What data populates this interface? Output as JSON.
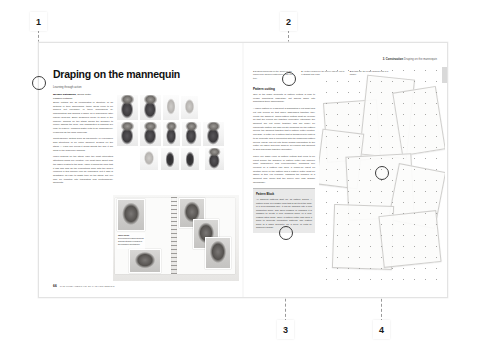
{
  "document": {
    "type": "book-spread",
    "background_color": "#ffffff",
    "page_color": "#ffffff",
    "accent_color": "#1a1a1a"
  },
  "callouts": [
    {
      "id": "1",
      "label": "1",
      "position": "top-left"
    },
    {
      "id": "2",
      "label": "2",
      "position": "top-center"
    },
    {
      "id": "3",
      "label": "3",
      "position": "bottom-center"
    },
    {
      "id": "4",
      "label": "4",
      "position": "bottom-right"
    }
  ],
  "left_page": {
    "headline": "Draping on the mannequin",
    "standfirst": "Learning through action",
    "byline_name": "Melanie Nathanson,",
    "byline_role": "Senior Tutor,",
    "byline_org": "Fashion Knitwear",
    "body": [
      "Some clothes are so complicated in structure or so detailed in their dimensions, these ideas need to be worked out physically in three dimensions by manipulating and draping a fabric on a mannequin after careful analysis. Since designers prefer to work in the manner, draping on the stand allows the designer to clearly assess the form. The possibilities of shaping are easy to resolve, enabling subtle cuts to be progressively examined as the work proceeds.",
      "Contemporary details such as asymmetry or expressive bias structures of an entire garment. Draped on the stand — each one keeps it forms affects the way it will hang in the sequence shaping.",
      "When draping on the stand, offer the most interesting attentions forms are created; you must think about how the fabric relates to the body. Make it follow the form that it has and how do the proportions work with the body? Working in this manner can be rewarding, but it also is debatable; its easy to waste time on the stand, but you may be tempted into translating and contemporary garments."
    ],
    "photo_grid_caption": "Draping sequence on the mannequin",
    "sketchbook_note_title": "Work book",
    "sketchbook_note_body": "Development pages showing draping studies recorded in the designer sketchbook.",
    "folio_number": "66",
    "folio_text": "THE FUNDAMENTALS OF FASHION DESIGN"
  },
  "right_page": {
    "running_head_section": "3. Construction",
    "running_head_title": "Draping on the mannequin",
    "captions": [
      {
        "label": "1",
        "text": "Draping garments for the jacket on the mannequin allows construction of the full toile."
      },
      {
        "label": "2",
        "text": "Another muslin for the sleeve can be cut to a straight and plain."
      },
      {
        "label": "3",
        "text": "Details like the seam finishes lock in a usable."
      }
    ],
    "subhead": "Pattern cutting",
    "body": [
      "One of the basic concepts of pattern cutting is how to render something essentially flat appear fabric into something three-dimensional.",
      "A paper pattern or a garment is dismantled if cut apart and cut into pieces so that when assembled together they create the garment. Good pattern cutting must be precise so that the pieces will together accurately otherwise the garment will not come together and will finally be inaccurate pattern will also create problems for the pattern pieces, the garment together that a pattern cutter creates. Likewise, a cutter on a pattern that is transferred to cloth is to be accurate and a connected with the balancing pattern pieces. These can cut into these seams information to the cutter, so fabric and help achieve an ironing and garment to sew and seam together accurately.",
      "There are basic rules of pattern cutting that need to be learnt before the designer or pattern cutter can improve more productively and experimentally. Changing one element of a pattern can have a knock-on effect on another piece of the pattern and a pattern cutter must be aware of this. For example, changing the armhole of a garment may mean that the sleeve may also change accordingly."
    ],
    "panel_title": "Pattern Block",
    "panel_body": "All garment patterns start life as pattern blocks. A pattern block is a master form that is set to fit the body in a fixed standard size. It can be modified into a new production block, and when finished or changed it is possible to create a new, modified block, or a new, custom fitted block. Once a pattern cutter has used a block to generate production patterns. The pattern block is a basic geometry for a piece of cloth by draping a design.",
    "pattern_caption": "Pattern pieces laid on the cutting table"
  }
}
